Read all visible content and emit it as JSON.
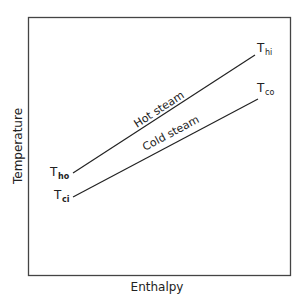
{
  "diagram": {
    "xlabel": "Enthalpy",
    "ylabel": "Temperature",
    "lines": [
      {
        "name": "Hot steam",
        "label": "Hot steam",
        "start_label": {
          "main": "T",
          "sub": "ho"
        },
        "end_label": {
          "main": "T",
          "sub": "hi"
        }
      },
      {
        "name": "Cold steam",
        "label": "Cold steam",
        "start_label": {
          "main": "T",
          "sub": "ci"
        },
        "end_label": {
          "main": "T",
          "sub": "co"
        }
      }
    ]
  }
}
